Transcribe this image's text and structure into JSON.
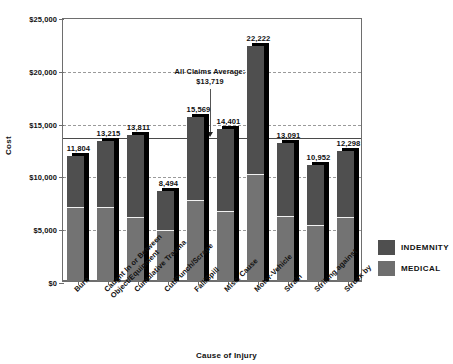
{
  "chart_data": {
    "type": "bar",
    "title": "",
    "xlabel": "Cause of Injury",
    "ylabel": "Cost",
    "ylim": [
      0,
      25000
    ],
    "ytick_values": [
      0,
      5000,
      10000,
      15000,
      20000,
      25000
    ],
    "ytick_labels": [
      "$0",
      "$5,000",
      "$10,000",
      "$15,000",
      "$20,000",
      "$25,000"
    ],
    "grid": true,
    "legend_position": "right",
    "stacked": true,
    "categories": [
      "Burn",
      "Caught In or Between\nObject/Equipment",
      "Cumulative Trauma",
      "Cut/Punch/Scrape",
      "Fall/Spill",
      "Misc. Cause",
      "Motor-Vehicle",
      "Strain",
      "Striking against",
      "Struck by"
    ],
    "totals": [
      11804,
      13215,
      13811,
      8494,
      15569,
      14401,
      22222,
      13091,
      10952,
      12298
    ],
    "total_labels": [
      "11,804",
      "13,215",
      "13,811",
      "8,494",
      "15,569",
      "14,401",
      "22,222",
      "13,091",
      "10,952",
      "12,298"
    ],
    "series": [
      {
        "name": "MEDICAL",
        "color": "#737373",
        "values": [
          7000,
          6950,
          6050,
          4750,
          7650,
          6550,
          10100,
          6100,
          5300,
          6000
        ]
      },
      {
        "name": "INDEMNITY",
        "color": "#4f4f4f",
        "values": [
          4804,
          6265,
          7761,
          3744,
          7919,
          7851,
          12122,
          6991,
          5652,
          6298
        ]
      }
    ],
    "annotations": [
      {
        "name": "all-claims-average",
        "line1": "All Claims Average:",
        "line2": "$13,719",
        "value": 13719
      }
    ]
  },
  "legend": {
    "items": [
      {
        "label": "INDEMNITY",
        "color": "#4f4f4f"
      },
      {
        "label": "MEDICAL",
        "color": "#6e6e6e"
      }
    ]
  }
}
